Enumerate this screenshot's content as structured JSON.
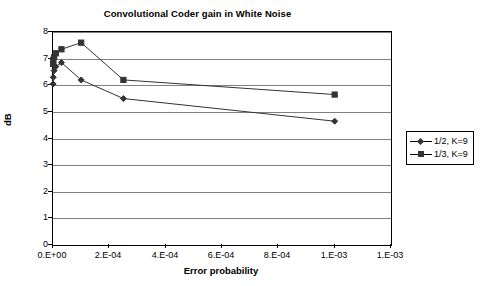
{
  "chart_data": {
    "type": "line",
    "title": "Convolutional Coder gain in White Noise",
    "xlabel": "Error probability",
    "ylabel": "dB",
    "xlim": [
      0,
      0.0012
    ],
    "ylim": [
      0,
      8
    ],
    "grid": true,
    "legend_position": "right",
    "x_tick_labels": [
      "0.E+00",
      "2.E-04",
      "4.E-04",
      "6.E-04",
      "8.E-04",
      "1.E-03",
      "1.E-03"
    ],
    "x_tick_values": [
      0,
      0.0002,
      0.0004,
      0.0006,
      0.0008,
      0.001,
      0.0012
    ],
    "y_tick_labels": [
      "0",
      "1",
      "2",
      "3",
      "4",
      "5",
      "6",
      "7",
      "8"
    ],
    "y_tick_values": [
      0,
      1,
      2,
      3,
      4,
      5,
      6,
      7,
      8
    ],
    "series": [
      {
        "name": "1/2, K=9",
        "marker": "diamond",
        "color": "#333333",
        "x": [
          5e-07,
          1e-06,
          4e-06,
          1e-05,
          3e-05,
          0.0001,
          0.00025,
          0.001
        ],
        "y": [
          6.05,
          6.3,
          6.55,
          6.7,
          6.85,
          6.2,
          5.5,
          4.65
        ]
      },
      {
        "name": "1/3, K=9",
        "marker": "square",
        "color": "#333333",
        "x": [
          5e-07,
          1e-06,
          4e-06,
          1e-05,
          3e-05,
          0.0001,
          0.00025,
          0.001
        ],
        "y": [
          6.8,
          6.95,
          7.05,
          7.2,
          7.35,
          7.6,
          6.2,
          5.65
        ]
      }
    ]
  },
  "legend": {
    "items": [
      {
        "label": "1/2, K=9",
        "marker": "diamond"
      },
      {
        "label": "1/3, K=9",
        "marker": "square"
      }
    ]
  }
}
